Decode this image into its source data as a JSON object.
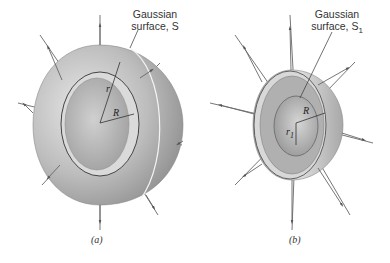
{
  "figure": {
    "panels": [
      {
        "id": "a",
        "caption": "(a)",
        "surface_label_line1": "Gaussian",
        "surface_label_line2": "surface, S",
        "symbol_r": "r",
        "symbol_R": "R"
      },
      {
        "id": "b",
        "caption": "(b)",
        "surface_label_line1": "Gaussian",
        "surface_label_line2": "surface, S",
        "surface_label_sub": "1",
        "symbol_R": "R",
        "symbol_r1": "r",
        "symbol_r1_sub": "1"
      }
    ]
  },
  "colors": {
    "sphere_dark": "#8c8c8c",
    "sphere_mid": "#b8b8b8",
    "sphere_light": "#e6e6e6",
    "ring_fill": "#d9d9d9",
    "field_line": "#555555",
    "text": "#333333"
  }
}
